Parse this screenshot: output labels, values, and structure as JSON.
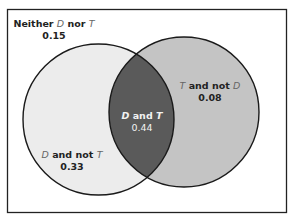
{
  "diagram": {
    "type": "venn",
    "sets": [
      "D",
      "T"
    ],
    "colors": {
      "frame": "#222222",
      "background": "#ffffff",
      "d_only_fill": "#ececec",
      "t_only_fill": "#c4c4c4",
      "intersection_fill": "#5a5a5a",
      "outline": "#1a1a1a"
    },
    "regions": {
      "neither": {
        "prefix": "Neither ",
        "var1": "D",
        "mid": " nor ",
        "var2": "T",
        "value": "0.15"
      },
      "d_not_t": {
        "var1": "D",
        "mid": " and not ",
        "var2": "T",
        "value": "0.33"
      },
      "d_and_t": {
        "var1": "D",
        "mid": " and ",
        "var2": "T",
        "value": "0.44"
      },
      "t_not_d": {
        "var1": "T",
        "mid": " and not ",
        "var2": "D",
        "value": "0.08"
      }
    }
  }
}
